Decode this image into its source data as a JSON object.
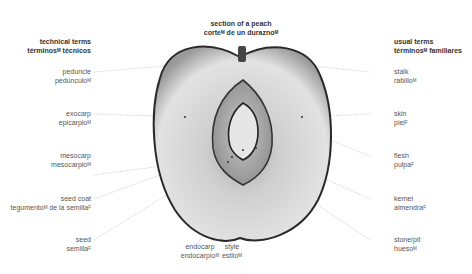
{
  "title": {
    "en": "section of a peach",
    "es": "corte",
    "es_rest": " de un durazno",
    "es_gender": "M"
  },
  "headers": {
    "left": {
      "en": "technical terms",
      "es": "términos",
      "es_rest": " técnicos",
      "es_gender": "M"
    },
    "right": {
      "en": "usual terms",
      "es": "términos",
      "es_rest": " familiares",
      "es_gender": "M"
    }
  },
  "left_labels": [
    {
      "en": "peduncle",
      "es": "pedúnculo",
      "g": "M"
    },
    {
      "en": "exocarp",
      "es": "epicarpio",
      "g": "M"
    },
    {
      "en": "mesocarp",
      "es": "mesocarpio",
      "g": "M"
    },
    {
      "en": "seed coat",
      "es": "tegumento",
      "es_rest": " de la semilla",
      "g": "M",
      "g2": "F"
    },
    {
      "en": "seed",
      "es": "semilla",
      "g": "F"
    }
  ],
  "bottom_labels": [
    {
      "en": "endocarp",
      "es": "endocarpio",
      "g": "M"
    },
    {
      "en": "style",
      "es": "estilo",
      "g": "M"
    }
  ],
  "right_labels": [
    {
      "en": "stalk",
      "es": "rabillo",
      "g": "M"
    },
    {
      "en": "skin",
      "es": "piel",
      "g": "F"
    },
    {
      "en": "flesh",
      "es": "pulpa",
      "g": "F"
    },
    {
      "en": "kernel",
      "es": "almendra",
      "g": "F"
    },
    {
      "en": "stone/pit",
      "es": "hueso",
      "g": "M"
    }
  ],
  "colors": {
    "text": "#555555",
    "header": "#333333",
    "leader": "#aaaaaa",
    "flesh": "#dcdcdc",
    "skin": "#2a2a2a"
  }
}
